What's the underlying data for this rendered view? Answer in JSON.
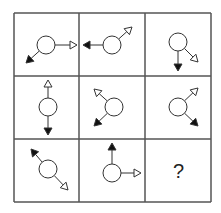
{
  "puzzle": {
    "grid": {
      "rows": 3,
      "cols": 3,
      "x_lines": [
        14,
        79,
        145,
        211
      ],
      "y_lines": [
        13,
        76,
        139,
        202
      ],
      "line_color": "#555555"
    },
    "cells": [
      {
        "row": 0,
        "col": 0,
        "circle": {
          "cx": 46,
          "cy": 45,
          "r": 9
        },
        "arrows": [
          {
            "type": "open",
            "x2": 77,
            "y2": 45
          },
          {
            "type": "filled",
            "x2": 26,
            "y2": 63
          }
        ]
      },
      {
        "row": 0,
        "col": 1,
        "circle": {
          "cx": 112,
          "cy": 45,
          "r": 9
        },
        "arrows": [
          {
            "type": "filled",
            "x2": 83,
            "y2": 45
          },
          {
            "type": "open",
            "x2": 132,
            "y2": 27
          }
        ]
      },
      {
        "row": 0,
        "col": 2,
        "circle": {
          "cx": 178,
          "cy": 42,
          "r": 9
        },
        "arrows": [
          {
            "type": "filled",
            "x2": 178,
            "y2": 71
          },
          {
            "type": "open",
            "x2": 198,
            "y2": 62
          }
        ]
      },
      {
        "row": 1,
        "col": 0,
        "circle": {
          "cx": 48,
          "cy": 107,
          "r": 9
        },
        "arrows": [
          {
            "type": "open",
            "x2": 48,
            "y2": 80
          },
          {
            "type": "filled",
            "x2": 48,
            "y2": 135
          }
        ]
      },
      {
        "row": 1,
        "col": 1,
        "circle": {
          "cx": 114,
          "cy": 107,
          "r": 9
        },
        "arrows": [
          {
            "type": "open",
            "x2": 94,
            "y2": 89
          },
          {
            "type": "filled",
            "x2": 94,
            "y2": 126
          }
        ]
      },
      {
        "row": 1,
        "col": 2,
        "circle": {
          "cx": 178,
          "cy": 107,
          "r": 9
        },
        "arrows": [
          {
            "type": "open",
            "x2": 198,
            "y2": 88
          },
          {
            "type": "filled",
            "x2": 198,
            "y2": 126
          }
        ]
      },
      {
        "row": 2,
        "col": 0,
        "circle": {
          "cx": 48,
          "cy": 169,
          "r": 9
        },
        "arrows": [
          {
            "type": "filled",
            "x2": 31,
            "y2": 149
          },
          {
            "type": "open",
            "x2": 68,
            "y2": 190
          }
        ]
      },
      {
        "row": 2,
        "col": 1,
        "circle": {
          "cx": 112,
          "cy": 173,
          "r": 9
        },
        "arrows": [
          {
            "type": "filled",
            "x2": 112,
            "y2": 143
          },
          {
            "type": "open",
            "x2": 141,
            "y2": 173
          }
        ]
      },
      {
        "row": 2,
        "col": 2,
        "unknown": true,
        "label": "?"
      }
    ],
    "colors": {
      "stroke": "#333333",
      "filled": "#111111",
      "open_fill": "#ffffff"
    }
  }
}
